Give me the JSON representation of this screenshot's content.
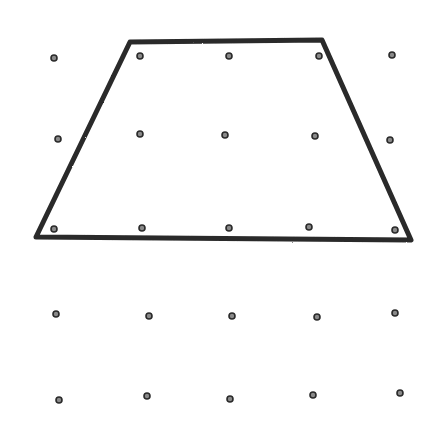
{
  "title": "Trapezoid drawn on a dot grid",
  "colors": {
    "background": "#ffffff",
    "stroke": "#2a2a2a",
    "dot_fill": "#8a8a8a",
    "dot_stroke": "#2a2a2a"
  },
  "grid": {
    "rows": 5,
    "cols": 5,
    "dots": [
      {
        "x": 54,
        "y": 58
      },
      {
        "x": 140,
        "y": 56
      },
      {
        "x": 229,
        "y": 56
      },
      {
        "x": 319,
        "y": 56
      },
      {
        "x": 392,
        "y": 55
      },
      {
        "x": 58,
        "y": 139
      },
      {
        "x": 140,
        "y": 134
      },
      {
        "x": 225,
        "y": 135
      },
      {
        "x": 315,
        "y": 136
      },
      {
        "x": 390,
        "y": 140
      },
      {
        "x": 54,
        "y": 229
      },
      {
        "x": 142,
        "y": 228
      },
      {
        "x": 229,
        "y": 228
      },
      {
        "x": 309,
        "y": 227
      },
      {
        "x": 395,
        "y": 230
      },
      {
        "x": 56,
        "y": 314
      },
      {
        "x": 149,
        "y": 316
      },
      {
        "x": 232,
        "y": 316
      },
      {
        "x": 317,
        "y": 317
      },
      {
        "x": 395,
        "y": 313
      },
      {
        "x": 59,
        "y": 400
      },
      {
        "x": 147,
        "y": 396
      },
      {
        "x": 230,
        "y": 399
      },
      {
        "x": 313,
        "y": 395
      },
      {
        "x": 400,
        "y": 393
      }
    ]
  },
  "shape": {
    "type": "trapezoid",
    "vertices": [
      {
        "label": "top-left",
        "x": 130,
        "y": 42
      },
      {
        "label": "top-right",
        "x": 322,
        "y": 40
      },
      {
        "label": "bottom-right",
        "x": 411,
        "y": 240
      },
      {
        "label": "bottom-left",
        "x": 36,
        "y": 237
      }
    ],
    "stroke_width": 5
  }
}
